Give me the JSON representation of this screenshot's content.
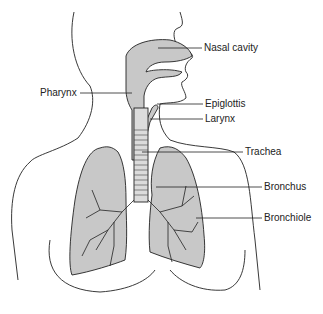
{
  "diagram": {
    "labels": {
      "nasal_cavity": "Nasal cavity",
      "pharynx": "Pharynx",
      "epiglottis": "Epiglottis",
      "larynx": "Larynx",
      "trachea": "Trachea",
      "bronchus": "Bronchus",
      "bronchiole": "Bronchiole"
    },
    "colors": {
      "airway_fill": "#c8c8c8",
      "outline": "#222222",
      "background": "#ffffff"
    }
  }
}
